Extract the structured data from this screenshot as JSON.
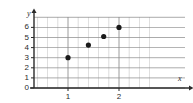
{
  "chart_data": {
    "type": "scatter",
    "title": "",
    "xlabel": "x",
    "ylabel": "y",
    "grid": true,
    "legend": "none",
    "xlim": [
      0,
      2.6
    ],
    "ylim": [
      0,
      7
    ],
    "x_major_ticks": [
      1,
      2
    ],
    "x_major_tick_labels": [
      "1",
      "2"
    ],
    "x_minor_step": 0.2,
    "y_major_ticks": [
      0,
      1,
      2,
      3,
      4,
      5,
      6
    ],
    "y_major_tick_labels": [
      "0",
      "1",
      "2",
      "3",
      "4",
      "5",
      "6"
    ],
    "points": [
      {
        "x": 1.0,
        "y": 3.0
      },
      {
        "x": 1.4,
        "y": 4.25
      },
      {
        "x": 1.7,
        "y": 5.1
      },
      {
        "x": 2.0,
        "y": 6.0
      }
    ],
    "marker": "filled-circle",
    "marker_color": "#1a1a1a",
    "grid_color": "#8c8c8c",
    "axis_color": "#2b2b2b"
  },
  "axes": {
    "y_name": "y",
    "x_name": "x"
  },
  "y_ticks": [
    "6",
    "5",
    "4",
    "3",
    "2",
    "1",
    "0"
  ],
  "x_ticks": [
    "1",
    "2"
  ]
}
